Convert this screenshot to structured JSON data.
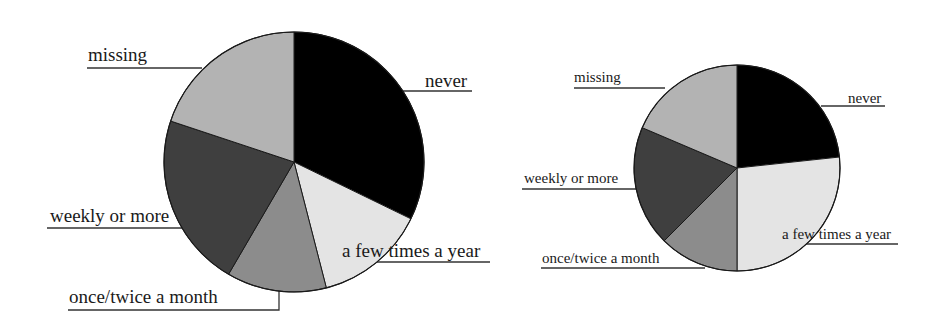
{
  "chart_data": [
    {
      "type": "pie",
      "title": "",
      "start_angle_deg": 0,
      "direction": "clockwise",
      "center": [
        294,
        162
      ],
      "radius": 130,
      "font_size": 19,
      "slices": [
        {
          "label": "never",
          "value": 32.2,
          "color": "#000000",
          "text_x": 425,
          "text_y": 87,
          "line": [
            [
              403,
              91
            ],
            [
              472,
              91
            ]
          ]
        },
        {
          "label": "a few times a year",
          "value": 13.8,
          "color": "#e4e4e4",
          "text_x": 342,
          "text_y": 257,
          "line": [
            [
              376,
              262
            ],
            [
              490,
              262
            ]
          ]
        },
        {
          "label": "once/twice a month",
          "value": 12.4,
          "color": "#8c8c8c",
          "text_x": 69,
          "text_y": 303,
          "line": [
            [
              68,
              310
            ],
            [
              279,
              310
            ],
            [
              279,
              291
            ]
          ]
        },
        {
          "label": "weekly or more",
          "value": 21.7,
          "color": "#3f3f3f",
          "text_x": 50,
          "text_y": 222,
          "line": [
            [
              47,
              228
            ],
            [
              184,
              228
            ]
          ]
        },
        {
          "label": "missing",
          "value": 19.9,
          "color": "#b3b3b3",
          "text_x": 88,
          "text_y": 61,
          "line": [
            [
              87,
              68
            ],
            [
              202,
              68
            ]
          ]
        }
      ]
    },
    {
      "type": "pie",
      "title": "",
      "start_angle_deg": 0,
      "direction": "clockwise",
      "center": [
        737,
        168
      ],
      "radius": 103,
      "font_size": 15,
      "slices": [
        {
          "label": "never",
          "value": 23.3,
          "color": "#000000",
          "text_x": 848,
          "text_y": 103,
          "line": [
            [
              821,
              106
            ],
            [
              885,
              106
            ]
          ]
        },
        {
          "label": "a few times a year",
          "value": 26.7,
          "color": "#e4e4e4",
          "text_x": 782,
          "text_y": 239,
          "line": [
            [
              805,
              244
            ],
            [
              898,
              244
            ]
          ]
        },
        {
          "label": "once/twice a month",
          "value": 12.5,
          "color": "#8c8c8c",
          "text_x": 542,
          "text_y": 263,
          "line": [
            [
              541,
              268
            ],
            [
              705,
              268
            ]
          ]
        },
        {
          "label": "weekly or more",
          "value": 18.9,
          "color": "#3f3f3f",
          "text_x": 524,
          "text_y": 183,
          "line": [
            [
              522,
              189
            ],
            [
              640,
              189
            ]
          ]
        },
        {
          "label": "missing",
          "value": 18.6,
          "color": "#b3b3b3",
          "text_x": 574,
          "text_y": 82,
          "line": [
            [
              574,
              88
            ],
            [
              665,
              88
            ]
          ]
        }
      ]
    }
  ]
}
